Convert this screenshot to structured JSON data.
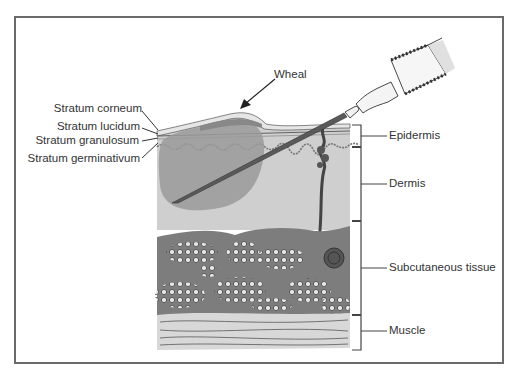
{
  "diagram": {
    "callouts": {
      "wheal": "Wheal"
    },
    "left_labels": [
      {
        "id": "stratum-corneum",
        "text": "Stratum corneum"
      },
      {
        "id": "stratum-lucidum",
        "text": "Stratum lucidum"
      },
      {
        "id": "stratum-granulosum",
        "text": "Stratum granulosum"
      },
      {
        "id": "stratum-germinativum",
        "text": "Stratum germinativum"
      }
    ],
    "right_labels": [
      {
        "id": "epidermis",
        "text": "Epidermis"
      },
      {
        "id": "dermis",
        "text": "Dermis"
      },
      {
        "id": "subcutaneous",
        "text": "Subcutaneous tissue"
      },
      {
        "id": "muscle",
        "text": "Muscle"
      }
    ],
    "colors": {
      "frame": "#6a6a6a",
      "dermis": "#cfcfcf",
      "wheal_fluid": "#9a9a9a",
      "subcutaneous": "#7d7d7d",
      "muscle": "#d8d8d8",
      "needle": "#5a5a5a",
      "line": "#333333"
    }
  }
}
